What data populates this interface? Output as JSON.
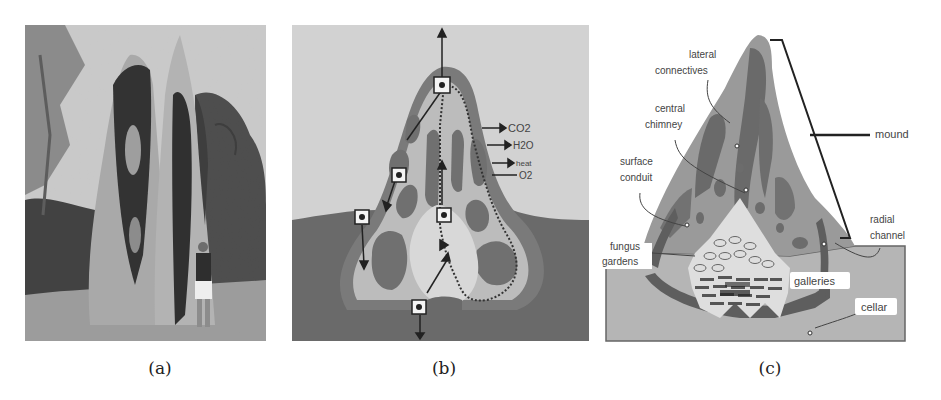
{
  "figure": {
    "panels": [
      {
        "id": "a",
        "caption": "(a)",
        "content": "photograph of a tall cathedral termite mound with a person standing beside it, trees in background"
      },
      {
        "id": "b",
        "caption": "(b)",
        "content": "schematic cross-section of mound showing air circulation paths",
        "labels": {
          "co2": "CO2",
          "h2o": "H2O",
          "heat": "heat",
          "o2": "O2"
        }
      },
      {
        "id": "c",
        "caption": "(c)",
        "content": "labeled cross-section of mound structure",
        "labels": {
          "lateral_1": "lateral",
          "lateral_2": "connectives",
          "central_1": "central",
          "central_2": "chimney",
          "surface_1": "surface",
          "surface_2": "conduit",
          "fungus_1": "fungus",
          "fungus_2": "gardens",
          "mound": "mound",
          "radial_1": "radial",
          "radial_2": "channel",
          "galleries": "galleries",
          "cellar": "cellar"
        }
      }
    ]
  }
}
